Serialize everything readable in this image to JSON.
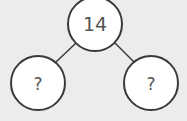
{
  "diagram": {
    "type": "number-bond",
    "top": {
      "label": "14"
    },
    "left": {
      "label": "?"
    },
    "right": {
      "label": "?"
    },
    "colors": {
      "background": "#ececec",
      "circle_fill": "#ffffff",
      "stroke": "#3a3a3a",
      "text": "#555555"
    }
  }
}
